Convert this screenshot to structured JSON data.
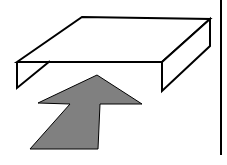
{
  "diagram": {
    "colors": {
      "background": "#ffffff",
      "stroke": "#000000",
      "arrow_fill": "#808080"
    },
    "elements": [
      {
        "name": "tray-box",
        "type": "isometric-box"
      },
      {
        "name": "gray-arrow",
        "type": "arrow",
        "direction": "up-right"
      },
      {
        "name": "divider-line",
        "type": "vertical-line"
      }
    ]
  }
}
